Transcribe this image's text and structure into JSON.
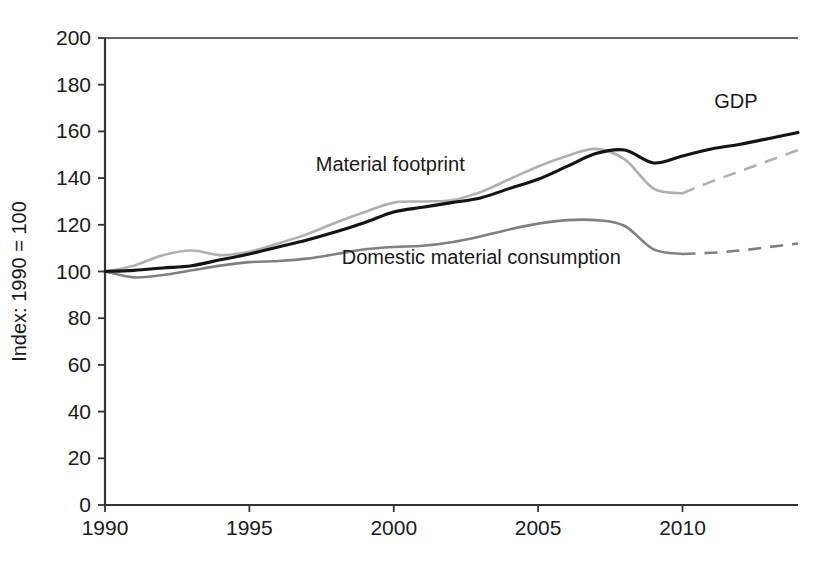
{
  "chart_data": {
    "type": "line",
    "title": "",
    "subtitle": "",
    "xlabel": "",
    "ylabel": "Index: 1990 = 100",
    "xlim": [
      1990,
      2014
    ],
    "ylim": [
      0,
      200
    ],
    "grid": false,
    "legend_position": "inline-annotations",
    "x_ticks": [
      1990,
      1995,
      2000,
      2005,
      2010
    ],
    "x_tick_labels": [
      "1990",
      "1995",
      "2000",
      "2005",
      "2010"
    ],
    "y_ticks": [
      0,
      20,
      40,
      60,
      80,
      100,
      120,
      140,
      160,
      180,
      200
    ],
    "y_tick_labels": [
      "0",
      "20",
      "40",
      "60",
      "80",
      "100",
      "120",
      "140",
      "160",
      "180",
      "200"
    ],
    "x": [
      1990,
      1991,
      1992,
      1993,
      1994,
      1995,
      1996,
      1997,
      1998,
      1999,
      2000,
      2001,
      2002,
      2003,
      2004,
      2005,
      2006,
      2007,
      2008,
      2009,
      2010,
      2011,
      2012,
      2013,
      2014
    ],
    "series": [
      {
        "name": "GDP",
        "label": "GDP",
        "color": "#141414",
        "style": "solid",
        "width": 3.1,
        "values": [
          100,
          100.5,
          101.5,
          102.5,
          105,
          107.5,
          110.5,
          113.5,
          117,
          121,
          125.5,
          127.5,
          129.5,
          131.5,
          135.5,
          139.5,
          145,
          150.5,
          152,
          146.5,
          149.5,
          152.5,
          154.5,
          157,
          159.5
        ],
        "dashed_from": null
      },
      {
        "name": "Material footprint",
        "label": "Material footprint",
        "color": "#b0b0b0",
        "style": "solid-then-dashed",
        "width": 2.6,
        "values": [
          100,
          102.5,
          107,
          109,
          107,
          108.5,
          112,
          116,
          121,
          125.5,
          129.5,
          130,
          130.5,
          134,
          139.5,
          145,
          149.5,
          152.5,
          148,
          135.5,
          133.5,
          138.5,
          143,
          147.5,
          152
        ],
        "dashed_from": 2010
      },
      {
        "name": "Domestic material consumption",
        "label": "Domestic material consumption",
        "color": "#808080",
        "style": "solid-then-dashed",
        "width": 2.6,
        "values": [
          100,
          97.5,
          98.5,
          100.5,
          102.5,
          104,
          104.5,
          105.5,
          107.5,
          109.5,
          110.5,
          111,
          112.5,
          115,
          118,
          120.5,
          122,
          122,
          119.5,
          109.5,
          107.5,
          108,
          109,
          110.5,
          112
        ],
        "dashed_from": 2010
      }
    ],
    "annotations": [
      {
        "name": "gdp-annotation",
        "text": "GDP",
        "x": 2011.1,
        "y": 170
      },
      {
        "name": "material-footprint-annotation",
        "text": "Material footprint",
        "x": 1997.3,
        "y": 143
      },
      {
        "name": "domestic-material-consumption-annotation",
        "text": "Domestic material consumption",
        "x": 1998.2,
        "y": 103
      }
    ],
    "axis_style": {
      "axis_color": "#333333",
      "top_border": true,
      "top_border_value": 200,
      "tick_length": 7
    }
  },
  "top_artifact": {
    "text": "                   "
  }
}
